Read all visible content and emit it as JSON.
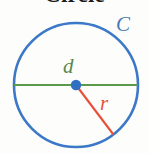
{
  "figure": {
    "title": "Circle",
    "title_color": "#1a1a1a",
    "background_color": "#fdfdfb"
  },
  "diagram": {
    "type": "geometry-circle",
    "circle": {
      "name": "circle-outline",
      "center_x": 76,
      "center_y": 85,
      "radius": 62,
      "stroke_color": "#3c78c8",
      "stroke_width": 2.6,
      "fill": "none"
    },
    "center_point": {
      "name": "center-dot",
      "x": 76,
      "y": 85,
      "radius": 5.2,
      "fill_color": "#2f6fc4"
    },
    "diameter_line": {
      "name": "diameter-line",
      "x1": 14,
      "y1": 85,
      "x2": 138,
      "y2": 85,
      "stroke_color": "#5a9a4a",
      "stroke_width": 2.1
    },
    "radius_line": {
      "name": "radius-line",
      "x1": 76,
      "y1": 85,
      "x2": 113,
      "y2": 134,
      "stroke_color": "#e8503a",
      "stroke_width": 2.1
    }
  },
  "labels": {
    "circumference": {
      "text": "C",
      "meaning": "circumference",
      "color": "#4a7ab5"
    },
    "diameter": {
      "text": "d",
      "meaning": "diameter",
      "color": "#5a8a4a"
    },
    "radius": {
      "text": "r",
      "meaning": "radius",
      "color": "#e8503a"
    }
  }
}
